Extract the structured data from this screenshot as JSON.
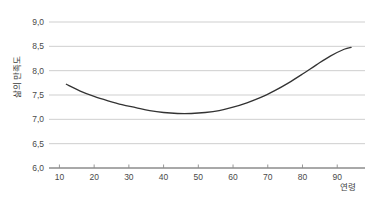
{
  "chart_data": {
    "type": "line",
    "title": "",
    "subtitle": "",
    "xlabel": "연령",
    "ylabel": "삶의 만족도",
    "xlim": [
      7,
      98
    ],
    "ylim": [
      6.0,
      9.0
    ],
    "grid": "horizontal",
    "legend": "none",
    "x_ticks": [
      "10",
      "20",
      "30",
      "40",
      "50",
      "60",
      "70",
      "80",
      "90"
    ],
    "x_tick_values": [
      10,
      20,
      30,
      40,
      50,
      60,
      70,
      80,
      90
    ],
    "y_ticks": [
      "6,0",
      "6,5",
      "7,0",
      "7,5",
      "8,0",
      "8,5",
      "9,0"
    ],
    "y_tick_values": [
      6.0,
      6.5,
      7.0,
      7.5,
      8.0,
      8.5,
      9.0
    ],
    "series": [
      {
        "name": "삶의 만족도",
        "color": "#333333",
        "x": [
          12,
          16,
          20,
          24,
          28,
          32,
          36,
          40,
          44,
          48,
          52,
          56,
          60,
          64,
          68,
          72,
          76,
          80,
          84,
          88,
          92,
          94
        ],
        "values": [
          7.72,
          7.58,
          7.47,
          7.38,
          7.3,
          7.24,
          7.18,
          7.14,
          7.12,
          7.12,
          7.14,
          7.18,
          7.25,
          7.34,
          7.45,
          7.59,
          7.75,
          7.93,
          8.12,
          8.3,
          8.44,
          8.48
        ]
      }
    ],
    "annotations": []
  },
  "axis": {
    "y_label": "삶의 만족도",
    "x_label": "연령"
  },
  "colors": {
    "curve": "#333333",
    "gridline": "#c9c9c9",
    "axis": "#8c8c8c",
    "tick_text": "#4a4a4a",
    "background": "#ffffff"
  }
}
